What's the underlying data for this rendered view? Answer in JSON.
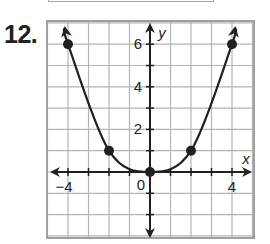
{
  "problem": {
    "number": "12."
  },
  "chart_data": {
    "type": "line",
    "title": "",
    "xlabel": "x",
    "ylabel": "y",
    "xlim": [
      -5,
      5
    ],
    "ylim": [
      -3,
      7
    ],
    "grid": true,
    "x_ticks": [
      -4,
      0,
      4
    ],
    "x_tick_labels": [
      "−4",
      "0",
      "4"
    ],
    "y_ticks": [
      2,
      4,
      6
    ],
    "y_tick_labels": [
      "2",
      "4",
      "6"
    ],
    "series": [
      {
        "name": "curve",
        "points": [
          [
            -4,
            6
          ],
          [
            -2,
            1
          ],
          [
            0,
            0
          ],
          [
            2,
            1
          ],
          [
            4,
            6
          ]
        ],
        "x": [
          -4,
          -2,
          0,
          2,
          4
        ],
        "values": [
          6,
          1,
          0,
          1,
          6
        ],
        "marked_points": true,
        "arrows_at_ends": true
      }
    ],
    "colors": {
      "grid": "#b4b4b4",
      "axis": "#231f20",
      "curve": "#231f20",
      "frame": "#a0a0a0"
    }
  }
}
